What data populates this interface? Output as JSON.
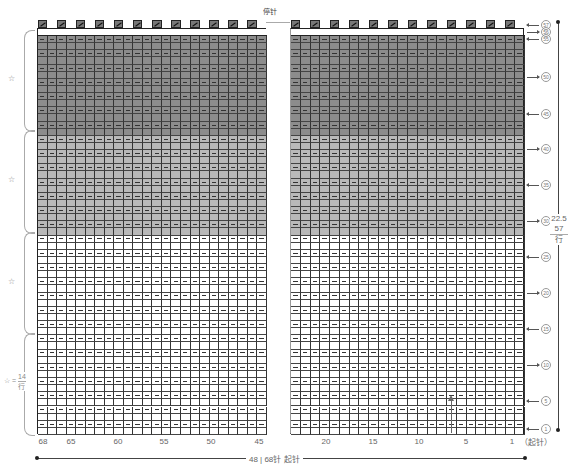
{
  "chart": {
    "top_label": "停针",
    "total_rows": 57,
    "total_stitches": 68,
    "left_block": {
      "from_stitch": 68,
      "to_stitch": 45,
      "columns": 24
    },
    "right_block": {
      "from_stitch": 24,
      "to_stitch": 1,
      "columns": 24
    },
    "shading_zones": [
      {
        "name": "dark",
        "rows_from": 43,
        "rows_to": 56,
        "color": "#8c8c8c"
      },
      {
        "name": "medium",
        "rows_from": 29,
        "rows_to": 42,
        "color": "#b9b9b9"
      },
      {
        "name": "white",
        "rows_from": 1,
        "rows_to": 28,
        "color": "#ffffff"
      }
    ],
    "top_row_symbol": "k2tog",
    "purl_symbol": "—",
    "bottom_column_labels": [
      {
        "label": "68",
        "x": 43
      },
      {
        "label": "65",
        "x": 71
      },
      {
        "label": "60",
        "x": 118
      },
      {
        "label": "55",
        "x": 164
      },
      {
        "label": "50",
        "x": 211
      },
      {
        "label": "45",
        "x": 259
      },
      {
        "label": "20",
        "x": 326
      },
      {
        "label": "15",
        "x": 373
      },
      {
        "label": "10",
        "x": 419
      },
      {
        "label": "5",
        "x": 466
      },
      {
        "label": "1",
        "x": 512
      }
    ],
    "start_label": "（起针）",
    "row_labels": [
      {
        "n": "57",
        "y": 24,
        "dir": "left"
      },
      {
        "n": "56",
        "y": 31,
        "dir": "right"
      },
      {
        "n": "55",
        "y": 38,
        "dir": "left"
      },
      {
        "n": "50",
        "y": 76,
        "dir": "right"
      },
      {
        "n": "45",
        "y": 113,
        "dir": "left"
      },
      {
        "n": "40",
        "y": 148,
        "dir": "right"
      },
      {
        "n": "35",
        "y": 184,
        "dir": "left"
      },
      {
        "n": "30",
        "y": 220,
        "dir": "right"
      },
      {
        "n": "25",
        "y": 256,
        "dir": "left"
      },
      {
        "n": "20",
        "y": 292,
        "dir": "right"
      },
      {
        "n": "15",
        "y": 328,
        "dir": "left"
      },
      {
        "n": "10",
        "y": 364,
        "dir": "right"
      },
      {
        "n": "5",
        "y": 400,
        "dir": "left"
      },
      {
        "n": "1",
        "y": 428,
        "dir": "left"
      }
    ],
    "height_label": {
      "cm": "22.5",
      "rows": "57",
      "unit": "行"
    },
    "width_label": "48 | 68针 起针",
    "left_braces": [
      {
        "label": "☆",
        "y_top": 30,
        "y_bot": 130
      },
      {
        "label": "☆",
        "y_top": 130,
        "y_bot": 232
      },
      {
        "label": "☆",
        "y_top": 232,
        "y_bot": 333
      },
      {
        "label": "☆ = 14 行",
        "y_top": 333,
        "y_bot": 434
      }
    ],
    "star_eq": {
      "star": "☆",
      "eq": "=",
      "rows": "14",
      "unit": "行"
    }
  }
}
